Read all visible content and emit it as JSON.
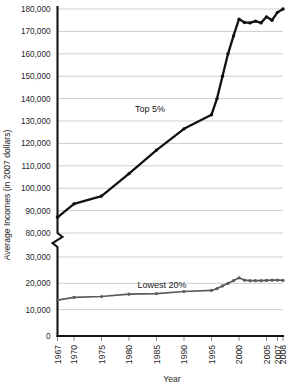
{
  "chart_data": {
    "type": "line",
    "title": "",
    "xlabel": "Year",
    "ylabel": "Average Incomes (in 2007 dollars)",
    "broken_axis": true,
    "y_upper_range": [
      80000,
      180000
    ],
    "y_lower_range": [
      0,
      30000
    ],
    "y_upper_ticks": [
      "80,000",
      "90,000",
      "100,000",
      "110,000",
      "120,000",
      "130,000",
      "140,000",
      "150,000",
      "160,000",
      "170,000",
      "180,000"
    ],
    "y_lower_ticks": [
      "0",
      "10,000",
      "20,000",
      "30,000"
    ],
    "x_ticks": [
      "1967",
      "1970",
      "1975",
      "1980",
      "1985",
      "1990",
      "1995",
      "2000",
      "2005",
      "2007",
      "2008"
    ],
    "x_range": [
      1967,
      2008
    ],
    "grid": true,
    "legend_position": "inline-annotation",
    "series": [
      {
        "name": "Top 5%",
        "color": "#111111",
        "label_text": "Top 5%",
        "x": [
          1967,
          1970,
          1975,
          1980,
          1985,
          1990,
          1995,
          1996,
          1997,
          1998,
          1999,
          2000,
          2001,
          2002,
          2003,
          2004,
          2005,
          2006,
          2007,
          2008
        ],
        "values": [
          87000,
          93000,
          96500,
          106500,
          117000,
          126500,
          132800,
          140000,
          150000,
          160000,
          168000,
          175500,
          174000,
          173800,
          174600,
          173800,
          176500,
          175000,
          178500,
          180000
        ]
      },
      {
        "name": "Lowest 20%",
        "color": "#5a5a5a",
        "label_text": "Lowest 20%",
        "x": [
          1967,
          1970,
          1975,
          1980,
          1985,
          1990,
          1995,
          1996,
          1997,
          1998,
          1999,
          2000,
          2001,
          2002,
          2003,
          2004,
          2005,
          2006,
          2007,
          2008
        ],
        "values": [
          13600,
          14700,
          15000,
          15900,
          16100,
          16900,
          17300,
          18000,
          19000,
          20000,
          21000,
          22100,
          21200,
          21000,
          21000,
          21000,
          21100,
          21200,
          21200,
          21100
        ]
      }
    ]
  },
  "annotations": {
    "top_label": "Top 5%",
    "bottom_label": "Lowest 20%"
  }
}
